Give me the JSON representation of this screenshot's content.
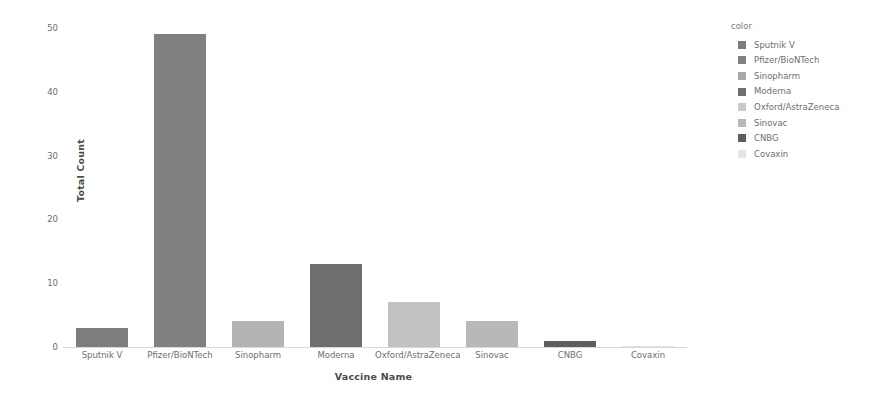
{
  "chart_data": {
    "type": "bar",
    "title": "",
    "subtitle": "",
    "xlabel": "Vaccine Name",
    "ylabel": "Total Count",
    "categories": [
      "Sputnik V",
      "Pfizer/BioNTech",
      "Sinopharm",
      "Moderna",
      "Oxford/AstraZeneca",
      "Sinovac",
      "CNBG",
      "Covaxin"
    ],
    "values": [
      3,
      49,
      4,
      13,
      7,
      4,
      1,
      0
    ],
    "ylim": [
      0,
      50
    ],
    "yticks": [
      0,
      10,
      20,
      30,
      40,
      50
    ],
    "ytick_labels": [
      "0",
      "10",
      "20",
      "30",
      "40",
      "50"
    ],
    "grid": false,
    "legend_position": "right",
    "colors": [
      "#7d7d7d",
      "#818181",
      "#b4b4b4",
      "#6f6f6f",
      "#c2c2c2",
      "#b8b8b8",
      "#5e5e5e",
      "#e2e2e2"
    ]
  },
  "legend": {
    "title": "color",
    "entries": [
      {
        "label": "Sputnik V",
        "color": "#7d7d7d"
      },
      {
        "label": "Pfizer/BioNTech",
        "color": "#818181"
      },
      {
        "label": "Sinopharm",
        "color": "#a8a8a8"
      },
      {
        "label": "Moderna",
        "color": "#6f6f6f"
      },
      {
        "label": "Oxford/AstraZeneca",
        "color": "#cacaca"
      },
      {
        "label": "Sinovac",
        "color": "#b8b8b8"
      },
      {
        "label": "CNBG",
        "color": "#5e5e5e"
      },
      {
        "label": "Covaxin",
        "color": "#e4e4e4"
      }
    ]
  },
  "axes": {
    "y_title": "Total Count",
    "x_title": "Vaccine Name"
  }
}
